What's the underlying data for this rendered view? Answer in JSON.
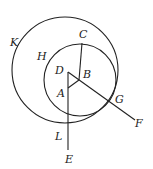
{
  "diagram": {
    "type": "geometry",
    "stroke_color": "#222222",
    "background": "#ffffff",
    "circles": [
      {
        "name": "large-circle",
        "label": "K",
        "cx": 65,
        "cy": 70,
        "r": 53
      },
      {
        "name": "small-circle",
        "label": "H",
        "cx": 80,
        "cy": 80,
        "r": 36
      }
    ],
    "points": {
      "A": {
        "label": "A",
        "x": 68,
        "y": 88
      },
      "B": {
        "label": "B",
        "x": 79,
        "y": 80
      },
      "C": {
        "label": "C",
        "x": 82,
        "y": 43
      },
      "D": {
        "label": "D",
        "x": 68,
        "y": 72
      },
      "E": {
        "label": "E",
        "x": 68,
        "y": 150
      },
      "F": {
        "label": "F",
        "x": 135,
        "y": 120
      },
      "G": {
        "label": "G",
        "x": 110,
        "y": 98
      },
      "H": {
        "label": "H",
        "x": 44,
        "y": 55
      },
      "K": {
        "label": "K",
        "x": 14,
        "y": 44
      },
      "L": {
        "label": "L",
        "x": 68,
        "y": 124
      }
    },
    "labels": [
      {
        "text": "K",
        "x": 10,
        "y": 46
      },
      {
        "text": "C",
        "x": 79,
        "y": 38
      },
      {
        "text": "H",
        "x": 37,
        "y": 60
      },
      {
        "text": "D",
        "x": 55,
        "y": 74
      },
      {
        "text": "B",
        "x": 83,
        "y": 78
      },
      {
        "text": "A",
        "x": 57,
        "y": 97
      },
      {
        "text": "G",
        "x": 115,
        "y": 103
      },
      {
        "text": "F",
        "x": 135,
        "y": 127
      },
      {
        "text": "L",
        "x": 55,
        "y": 140
      },
      {
        "text": "E",
        "x": 65,
        "y": 163
      }
    ]
  }
}
